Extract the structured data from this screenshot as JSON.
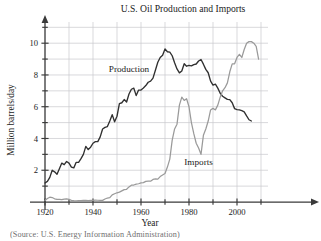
{
  "figure": {
    "title": "U.S. Oil Production and Imports",
    "caption": "(Source: U.S. Energy Information Administration)"
  },
  "chart_data": {
    "type": "line",
    "title": "U.S. Oil Production and Imports",
    "xlabel": "Year",
    "ylabel": "Million barrels/day",
    "xlim": [
      1917,
      2012
    ],
    "ylim": [
      0,
      11
    ],
    "grid": true,
    "legend": "inline-annotations",
    "xticks": [
      1920,
      1940,
      1960,
      1980,
      2000
    ],
    "xticks_minor": [
      1930,
      1950,
      1970,
      1990,
      2010
    ],
    "yticks": [
      2,
      4,
      6,
      8,
      10
    ],
    "yticks_minor": [
      1,
      3,
      5,
      7,
      9,
      11
    ],
    "annotations": [
      {
        "text": "Production",
        "x": 1955,
        "y": 8.2
      },
      {
        "text": "Imports",
        "x": 1984,
        "y": 2.3
      }
    ],
    "series": [
      {
        "name": "Production",
        "color": "#303030",
        "x": [
          1920,
          1921,
          1922,
          1923,
          1924,
          1925,
          1926,
          1927,
          1928,
          1929,
          1930,
          1931,
          1932,
          1933,
          1934,
          1935,
          1936,
          1937,
          1938,
          1939,
          1940,
          1941,
          1942,
          1943,
          1944,
          1945,
          1946,
          1947,
          1948,
          1949,
          1950,
          1951,
          1952,
          1953,
          1954,
          1955,
          1956,
          1957,
          1958,
          1959,
          1960,
          1961,
          1962,
          1963,
          1964,
          1965,
          1966,
          1967,
          1968,
          1969,
          1970,
          1971,
          1972,
          1973,
          1974,
          1975,
          1976,
          1977,
          1978,
          1979,
          1980,
          1981,
          1982,
          1983,
          1984,
          1985,
          1986,
          1987,
          1988,
          1989,
          1990,
          1991,
          1992,
          1993,
          1994,
          1995,
          1996,
          1997,
          1998,
          1999,
          2000,
          2001,
          2002,
          2003,
          2004,
          2005,
          2006
        ],
        "values": [
          1.2,
          1.3,
          1.55,
          2.0,
          1.9,
          1.75,
          2.1,
          2.45,
          2.35,
          2.55,
          2.45,
          2.2,
          2.15,
          2.5,
          2.5,
          2.73,
          3.0,
          3.5,
          3.3,
          3.45,
          3.7,
          3.8,
          3.8,
          4.1,
          4.6,
          4.7,
          4.75,
          5.1,
          5.5,
          5.05,
          5.4,
          6.2,
          6.25,
          6.45,
          6.3,
          6.8,
          7.1,
          7.17,
          6.7,
          7.05,
          7.05,
          7.18,
          7.33,
          7.54,
          7.61,
          7.8,
          8.3,
          8.8,
          9.1,
          9.24,
          9.64,
          9.46,
          9.44,
          9.21,
          8.77,
          8.38,
          8.13,
          8.25,
          8.71,
          8.55,
          8.6,
          8.57,
          8.65,
          8.69,
          8.88,
          8.97,
          8.68,
          8.35,
          8.14,
          7.61,
          7.36,
          7.42,
          7.17,
          6.85,
          6.66,
          6.56,
          6.46,
          6.45,
          6.25,
          5.88,
          5.82,
          5.8,
          5.75,
          5.68,
          5.42,
          5.18,
          5.1
        ]
      },
      {
        "name": "Imports",
        "color": "#9a9a9a",
        "x": [
          1920,
          1921,
          1922,
          1923,
          1924,
          1925,
          1926,
          1927,
          1928,
          1929,
          1930,
          1931,
          1932,
          1933,
          1934,
          1935,
          1936,
          1937,
          1938,
          1939,
          1940,
          1941,
          1942,
          1943,
          1944,
          1945,
          1946,
          1947,
          1948,
          1949,
          1950,
          1951,
          1952,
          1953,
          1954,
          1955,
          1956,
          1957,
          1958,
          1959,
          1960,
          1961,
          1962,
          1963,
          1964,
          1965,
          1966,
          1967,
          1968,
          1969,
          1970,
          1971,
          1972,
          1973,
          1974,
          1975,
          1976,
          1977,
          1978,
          1979,
          1980,
          1981,
          1982,
          1983,
          1984,
          1985,
          1986,
          1987,
          1988,
          1989,
          1990,
          1991,
          1992,
          1993,
          1994,
          1995,
          1996,
          1997,
          1998,
          1999,
          2000,
          2001,
          2002,
          2003,
          2004,
          2005,
          2006,
          2007,
          2008,
          2009
        ],
        "values": [
          0.1,
          0.22,
          0.3,
          0.28,
          0.2,
          0.17,
          0.16,
          0.15,
          0.18,
          0.2,
          0.17,
          0.1,
          0.08,
          0.07,
          0.08,
          0.09,
          0.1,
          0.11,
          0.09,
          0.1,
          0.1,
          0.12,
          0.11,
          0.1,
          0.1,
          0.19,
          0.25,
          0.27,
          0.45,
          0.52,
          0.58,
          0.62,
          0.7,
          0.78,
          0.8,
          0.95,
          1.06,
          1.07,
          1.12,
          1.15,
          1.2,
          1.22,
          1.3,
          1.31,
          1.31,
          1.42,
          1.45,
          1.44,
          1.6,
          1.7,
          1.8,
          2.2,
          2.7,
          3.9,
          4.6,
          4.9,
          6.1,
          6.6,
          6.4,
          6.5,
          6.0,
          5.0,
          4.3,
          3.7,
          3.4,
          3.0,
          4.2,
          4.6,
          5.1,
          5.8,
          5.9,
          5.8,
          6.1,
          6.6,
          7.0,
          7.2,
          7.5,
          8.2,
          8.7,
          8.7,
          9.1,
          9.3,
          9.1,
          9.6,
          10.0,
          10.1,
          10.1,
          10.0,
          9.8,
          9.0
        ]
      }
    ]
  }
}
